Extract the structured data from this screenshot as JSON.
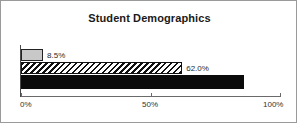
{
  "chart_data": {
    "type": "bar",
    "orientation": "horizontal",
    "title": "Student Demographics",
    "xlabel": "",
    "ylabel": "",
    "categories": [
      "series-1",
      "series-2",
      "series-3"
    ],
    "values": [
      8.5,
      62.0,
      85.9
    ],
    "value_labels": [
      "8.5%",
      "62.0%",
      "85.9%"
    ],
    "bar_styles": [
      "light-gray-fill",
      "diagonal-hatch",
      "solid-black"
    ],
    "xlim": [
      0,
      100
    ],
    "xticks": [
      0,
      50,
      100
    ],
    "xtick_labels": [
      "0%",
      "50%",
      "100%"
    ],
    "grid": false,
    "legend": false
  },
  "frame": {
    "border_color": "#9a9a9a",
    "background": "#ffffff"
  },
  "axis": {
    "ticks": [
      {
        "label": "0%",
        "value": 0
      },
      {
        "label": "50%",
        "value": 50
      },
      {
        "label": "100%",
        "value": 100
      }
    ]
  }
}
